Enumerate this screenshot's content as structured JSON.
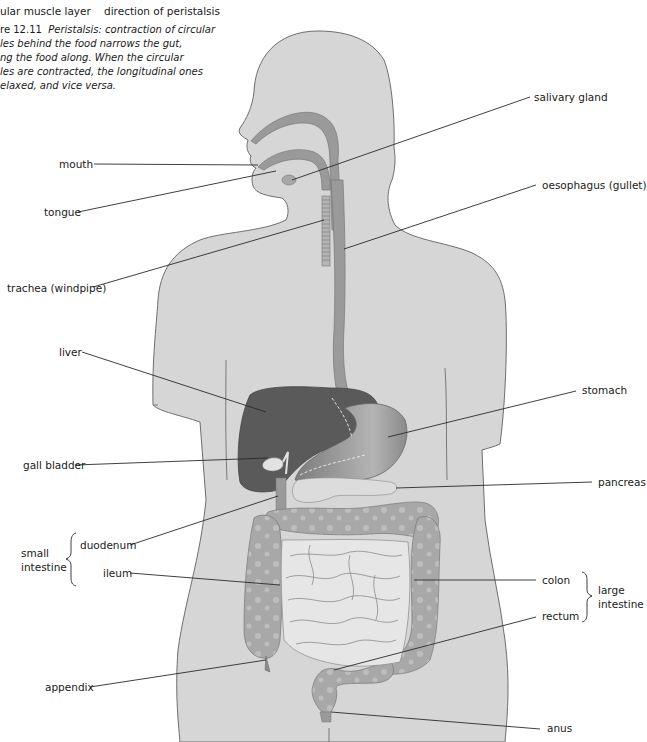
{
  "figure_top": {
    "muscle_layer_label": "ular muscle layer",
    "direction_label": "direction of peristalsis"
  },
  "caption": {
    "figure_number": "re 12.11",
    "lines": [
      "Peristalsis: contraction of circular",
      "les behind the food narrows the gut,",
      "ng the food along. When the circular",
      "les are contracted, the longitudinal ones",
      "elaxed, and vice versa."
    ]
  },
  "diagram": {
    "colors": {
      "body_fill": "#d6d6d6",
      "body_outline": "#6e6e6e",
      "tract_fill": "#9a9a9a",
      "liver_fill": "#5a5a5a",
      "stomach_fill": "#8e8e8e",
      "small_intestine_fill": "#e6e6e6",
      "colon_fill": "#a8a8a8",
      "leader_line": "#2a2a2a"
    },
    "labels": {
      "mouth": "mouth",
      "tongue": "tongue",
      "trachea": "trachea (windpipe)",
      "salivary_gland": "salivary gland",
      "oesophagus": "oesophagus (gullet)",
      "liver": "liver",
      "stomach": "stomach",
      "gall_bladder": "gall bladder",
      "pancreas": "pancreas",
      "duodenum": "duodenum",
      "ileum": "ileum",
      "colon": "colon",
      "rectum": "rectum",
      "appendix": "appendix",
      "anus": "anus"
    },
    "groups": {
      "small_intestine": [
        "small",
        "intestine"
      ],
      "large_intestine": [
        "large",
        "intestine"
      ]
    }
  }
}
